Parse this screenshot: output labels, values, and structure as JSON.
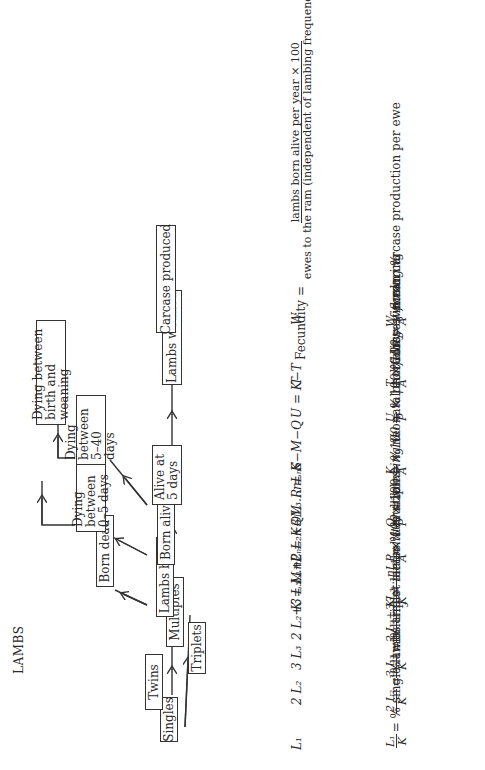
{
  "title": "LAMBS",
  "flowchart": {
    "boxes": {
      "singles": "Singles",
      "twins": "Twins",
      "triplets": "Triplets",
      "multiples": "Multiples",
      "lambs_born": "Lambs born",
      "born_dead": "Born dead",
      "born_alive": "Born alive",
      "dying_0_5": "Dying between 0–5 days",
      "alive_5": "Alive at 5 days",
      "dying_5_40": "Dying between 5–40 days",
      "dying_birth_weaning": "Dying between birth and weaning",
      "lambs_weaned": "Lambs weaned",
      "carcase": "Carcase produced"
    }
  },
  "formulas": [
    {
      "symbol": "L₁",
      "expression": "L₁/K = % single lambs"
    },
    {
      "symbol": "2 L₂",
      "expression": "2 L₂/K = % twin lambs"
    },
    {
      "symbol": "3 L₃",
      "expression": "3 L₃/K = % triplet lambs"
    },
    {
      "symbol": "2 L₂+3 L₃…nLₙ",
      "expression": "(2 L₂+3 L₃…nLₙ)/K = % multiples"
    },
    {
      "symbol": "K = L₁+2 L₂+3 L₃…nLₙ",
      "expression": "K/J = mean litter size",
      "expression2": "K/A × 100 = % prolificacy of flock"
    },
    {
      "symbol": "M",
      "expression": ""
    },
    {
      "symbol": "P = K−M",
      "expression": "P/A × 100 = lambing %"
    },
    {
      "symbol": "Q",
      "expression": "Q/P × 100 = % neonatal mortality"
    },
    {
      "symbol": "R = K−M−Q",
      "expression": ""
    },
    {
      "symbol": "S",
      "expression": ""
    },
    {
      "symbol": "U = K−T",
      "expression": "U/P × 100 % losses in rearing"
    },
    {
      "symbol": "T",
      "expression": "T/A × 100 = weaning %"
    },
    {
      "symbol": "Fecundity",
      "numerator": "lambs born alive per year × 100",
      "denominator": "ewes to the ram (independent of lambing frequency)"
    },
    {
      "symbol": "W",
      "expression": "W/A mean carcase production per ewe"
    }
  ],
  "text": {
    "L1": "L",
    "s1": "1",
    "pct_single": "= % single lambs",
    "pct_twin": "= % twin lambs",
    "pct_triplet": "= % triplet lambs",
    "pct_multiples": "= % multiples",
    "mean_litter": "= mean litter size",
    "prolificacy": "× 100 = % prolificacy of flock",
    "lambing": "× 100 = lambing %",
    "neonatal": "× 100 = % neonatal mortality",
    "rearing": "× 100 % losses in rearing",
    "weaning": "× 100 = weaning %",
    "fecundity_label": "Fecundity =",
    "fec_num": "lambs born alive per year × 100",
    "fec_den": "ewes to the ram (independent of lambing frequency)",
    "carcase_per_ewe": "mean carcase production per ewe"
  }
}
